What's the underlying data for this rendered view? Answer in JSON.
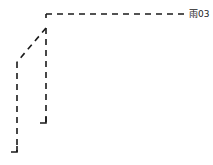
{
  "diagram": {
    "type": "pipe-network-fragment",
    "line_style": "dashed",
    "line_color": "#1a1a1a",
    "label": {
      "text": "雨03",
      "x": 189,
      "y": 17
    },
    "segments": [
      {
        "name": "top-horizontal",
        "points": [
          [
            46,
            14
          ],
          [
            186,
            14
          ]
        ]
      },
      {
        "name": "corner-tick",
        "points": [
          [
            46,
            14
          ],
          [
            46,
            18
          ]
        ]
      },
      {
        "name": "inner-vertical",
        "points": [
          [
            46,
            28
          ],
          [
            46,
            123
          ]
        ]
      },
      {
        "name": "inner-hook",
        "points": [
          [
            46,
            123
          ],
          [
            40,
            123
          ]
        ]
      },
      {
        "name": "diagonal",
        "points": [
          [
            46,
            28
          ],
          [
            17,
            62
          ]
        ]
      },
      {
        "name": "outer-vertical",
        "points": [
          [
            17,
            62
          ],
          [
            17,
            152
          ]
        ]
      },
      {
        "name": "outer-hook",
        "points": [
          [
            17,
            152
          ],
          [
            11,
            152
          ]
        ]
      }
    ]
  }
}
